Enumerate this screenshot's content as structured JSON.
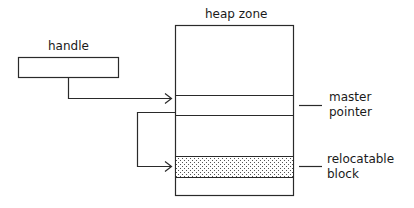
{
  "diagram": {
    "title": "heap zone",
    "handle_label": "handle",
    "master_pointer_label_line1": "master",
    "master_pointer_label_line2": "pointer",
    "relocatable_block_label_line1": "relocatable",
    "relocatable_block_label_line2": "block",
    "colors": {
      "stroke": "#2a2a2a",
      "background": "#ffffff",
      "dot_fill": "#555555"
    }
  }
}
